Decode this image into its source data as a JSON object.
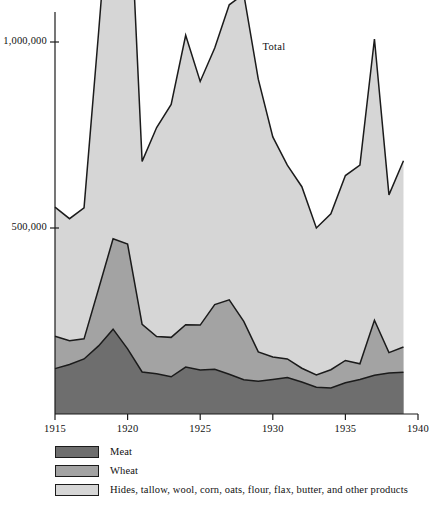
{
  "chart_data": {
    "type": "area",
    "stacked": true,
    "title": "",
    "subtitle": "",
    "xlabel": "",
    "ylabel": "",
    "xlim": [
      1915,
      1939
    ],
    "ylim": [
      0,
      1130000
    ],
    "grid": false,
    "legend_position": "below-plot",
    "annotations": [
      {
        "text": "Total",
        "x": 1929.3,
        "y": 985000
      }
    ],
    "x": [
      1915,
      1916,
      1917,
      1918,
      1919,
      1920,
      1921,
      1922,
      1923,
      1924,
      1925,
      1926,
      1927,
      1928,
      1929,
      1930,
      1931,
      1932,
      1933,
      1934,
      1935,
      1936,
      1937,
      1938,
      1939
    ],
    "xticks": [
      1915,
      1920,
      1925,
      1930,
      1935,
      1940
    ],
    "xticklabels": [
      "1915",
      "1920",
      "1925",
      "1930",
      "1935",
      "1940"
    ],
    "yticks": [
      500000,
      1000000
    ],
    "yticklabels": [
      "500,000",
      "1,000,000"
    ],
    "series": [
      {
        "name": "Meat",
        "color": "#6e6e6e",
        "values": [
          122000,
          133000,
          148000,
          183000,
          228000,
          175000,
          113000,
          108000,
          100000,
          126000,
          118000,
          120000,
          107000,
          92000,
          88000,
          93000,
          98000,
          86000,
          72000,
          70000,
          84000,
          93000,
          104000,
          110000,
          112000
        ]
      },
      {
        "name": "Wheat",
        "color": "#a3a3a3",
        "values": [
          87000,
          64000,
          54000,
          153000,
          243000,
          282000,
          128000,
          100000,
          106000,
          114000,
          121000,
          174000,
          200000,
          157000,
          79000,
          60000,
          50000,
          37000,
          33000,
          49000,
          60000,
          42000,
          148000,
          55000,
          68000
        ]
      },
      {
        "name": "Hides, tallow, wool, corn, oats, flour, flax, butter, and other products",
        "color": "#d6d6d6",
        "values": [
          347000,
          328000,
          352000,
          689000,
          1039000,
          1063000,
          438000,
          562000,
          626000,
          778000,
          655000,
          690000,
          793000,
          880000,
          733000,
          592000,
          521000,
          488000,
          395000,
          419000,
          497000,
          534000,
          756000,
          424000,
          501000
        ]
      }
    ],
    "totals": [
      556000,
      525000,
      554000,
      1025000,
      1510000,
      1520000,
      679000,
      770000,
      832000,
      1018000,
      894000,
      984000,
      1100000,
      1129000,
      900000,
      745000,
      669000,
      611000,
      500000,
      538000,
      641000,
      669000,
      1008000,
      589000,
      681000
    ]
  },
  "axis": {
    "y_labels": [
      "1,000,000",
      "500,000"
    ],
    "x_labels": [
      "1915",
      "1920",
      "1925",
      "1930",
      "1935",
      "1940"
    ]
  },
  "annotation": {
    "total_label": "Total"
  },
  "legend": {
    "items": [
      {
        "label": "Meat",
        "color": "#6e6e6e"
      },
      {
        "label": "Wheat",
        "color": "#a3a3a3"
      },
      {
        "label": "Hides, tallow, wool, corn, oats, flour, flax, butter, and other products",
        "color": "#d6d6d6"
      }
    ]
  },
  "caption": {
    "partial_text": ""
  }
}
